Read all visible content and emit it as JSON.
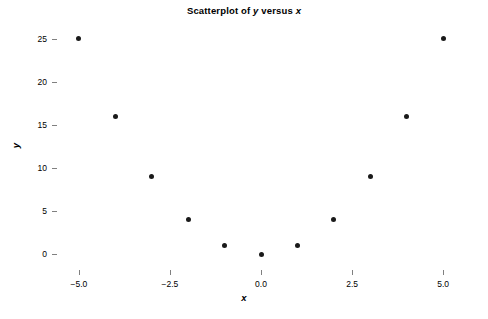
{
  "chart_data": {
    "type": "scatter",
    "title": "Scatterplot of y versus x",
    "title_prefix": "Scatterplot of ",
    "title_var_y": "y",
    "title_middle": " versus ",
    "title_var_x": "x",
    "xlabel": "x",
    "ylabel": "y",
    "grid": false,
    "legend": null,
    "xlim": [
      -5.6,
      5.6
    ],
    "ylim": [
      -1.8,
      26.6
    ],
    "x_ticks": [
      -5.0,
      -2.5,
      0.0,
      2.5,
      5.0
    ],
    "x_tick_labels": [
      "−5.0",
      "−2.5",
      "0.0",
      "2.5",
      "5.0"
    ],
    "y_ticks": [
      0,
      5,
      10,
      15,
      20,
      25
    ],
    "y_tick_labels": [
      "0",
      "5",
      "10",
      "15",
      "20",
      "25"
    ],
    "marker": "filled-circle",
    "marker_color": "#1a1a1a",
    "relationship": "y = x squared",
    "x": [
      -5,
      -4,
      -3,
      -2,
      -1,
      0,
      1,
      2,
      3,
      4,
      5
    ],
    "y": [
      25,
      16,
      9,
      4,
      1,
      0,
      1,
      4,
      9,
      16,
      25
    ],
    "points": [
      {
        "x": -5,
        "y": 25
      },
      {
        "x": -4,
        "y": 16
      },
      {
        "x": -3,
        "y": 9
      },
      {
        "x": -2,
        "y": 4
      },
      {
        "x": -1,
        "y": 1
      },
      {
        "x": 0,
        "y": 0
      },
      {
        "x": 1,
        "y": 1
      },
      {
        "x": 2,
        "y": 4
      },
      {
        "x": 3,
        "y": 9
      },
      {
        "x": 4,
        "y": 16
      },
      {
        "x": 5,
        "y": 25
      }
    ]
  },
  "style": {
    "frame_color": "#808080",
    "background": "#ffffff",
    "text_color": "#000000"
  }
}
